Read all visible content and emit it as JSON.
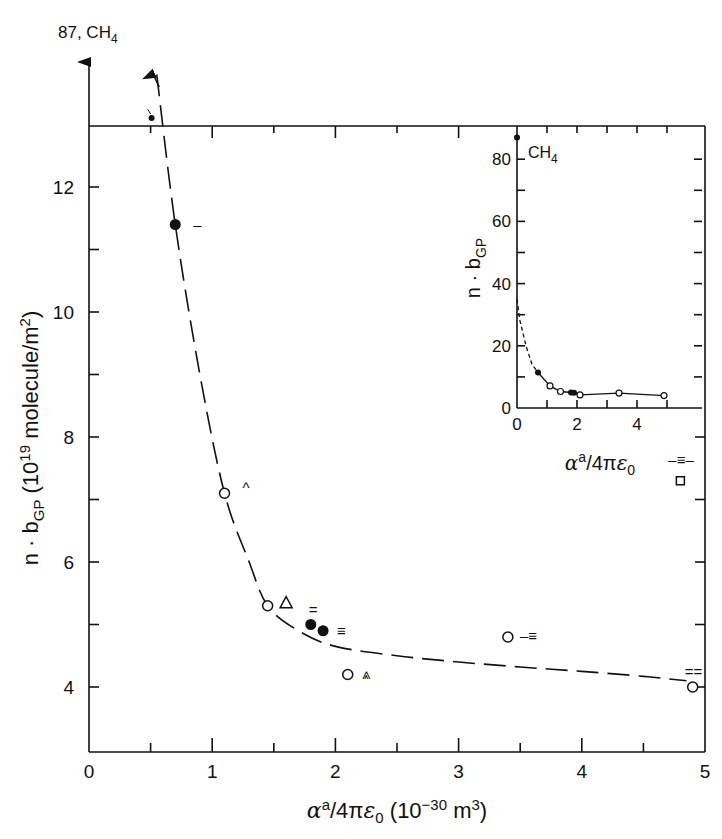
{
  "chart_data": [
    {
      "id": "main",
      "type": "scatter",
      "title": "",
      "xlabel": "α^a/4πε0 (10^-30 m^3)",
      "ylabel": "n·bGP (10^19 molecule/m^2)",
      "xlim": [
        0,
        5
      ],
      "ylim": [
        3,
        13
      ],
      "x_ticks": [
        "0",
        "1",
        "2",
        "3",
        "4",
        "5"
      ],
      "y_ticks": [
        "4",
        "6",
        "8",
        "10",
        "12"
      ],
      "grid": false,
      "off_scale_annotation": "87, CH4",
      "points": [
        {
          "x": 0.5,
          "y": 13.2,
          "marker": "small-filled",
          "label": ""
        },
        {
          "x": 0.7,
          "y": 11.4,
          "marker": "filled-circle",
          "label": "–"
        },
        {
          "x": 1.1,
          "y": 7.1,
          "marker": "open-circle",
          "label": "^"
        },
        {
          "x": 1.45,
          "y": 5.3,
          "marker": "open-circle",
          "label": ""
        },
        {
          "x": 1.6,
          "y": 5.35,
          "marker": "triangle",
          "label": ""
        },
        {
          "x": 1.8,
          "y": 5.0,
          "marker": "filled-circle",
          "label": "="
        },
        {
          "x": 1.9,
          "y": 4.9,
          "marker": "filled-circle",
          "label": "≡"
        },
        {
          "x": 2.1,
          "y": 4.2,
          "marker": "open-circle",
          "label": "⩓"
        },
        {
          "x": 3.4,
          "y": 4.8,
          "marker": "open-circle",
          "label": "–≡"
        },
        {
          "x": 4.9,
          "y": 4.0,
          "marker": "open-circle",
          "label": "=="
        },
        {
          "x": 4.8,
          "y": 7.3,
          "marker": "square",
          "label": "–≡–"
        }
      ],
      "curve": {
        "style": "long-dash",
        "x": [
          0.55,
          0.7,
          0.9,
          1.1,
          1.3,
          1.45,
          1.7,
          2.0,
          2.5,
          3.0,
          3.5,
          4.0,
          4.5,
          4.85
        ],
        "y": [
          13.8,
          11.4,
          9.0,
          7.1,
          6.0,
          5.3,
          4.9,
          4.65,
          4.5,
          4.4,
          4.32,
          4.25,
          4.17,
          4.1
        ]
      }
    },
    {
      "id": "inset",
      "type": "scatter",
      "title": "",
      "xlabel": "α^a/4πε0",
      "ylabel": "n·bGP",
      "xlim": [
        0,
        6
      ],
      "ylim": [
        0,
        90
      ],
      "x_ticks": [
        "0",
        "2",
        "4"
      ],
      "y_ticks": [
        "0",
        "20",
        "40",
        "60",
        "80"
      ],
      "annotation": "CH4",
      "points": [
        {
          "x": 0.0,
          "y": 87,
          "marker": "filled-circle"
        },
        {
          "x": 0.7,
          "y": 11.4,
          "marker": "filled-circle"
        },
        {
          "x": 1.1,
          "y": 7.1,
          "marker": "open-circle"
        },
        {
          "x": 1.45,
          "y": 5.3,
          "marker": "open-circle"
        },
        {
          "x": 1.8,
          "y": 5.0,
          "marker": "filled-circle"
        },
        {
          "x": 1.9,
          "y": 4.9,
          "marker": "filled-circle"
        },
        {
          "x": 2.1,
          "y": 4.2,
          "marker": "open-circle"
        },
        {
          "x": 3.4,
          "y": 4.8,
          "marker": "open-circle"
        },
        {
          "x": 4.9,
          "y": 4.0,
          "marker": "open-circle"
        }
      ],
      "curve_dashed": {
        "x": [
          0.0,
          0.1,
          0.3,
          0.5,
          0.7
        ],
        "y": [
          35,
          28,
          20,
          14,
          11.4
        ]
      },
      "curve_solid": {
        "x": [
          0.7,
          1.1,
          1.45,
          1.9,
          2.1,
          3.4,
          4.9
        ],
        "y": [
          11.4,
          7.1,
          5.3,
          4.9,
          4.2,
          4.8,
          4.0
        ]
      }
    }
  ],
  "labels": {
    "top_annotation": "87, CH4",
    "main_x_ticks": [
      "0",
      "1",
      "2",
      "3",
      "4",
      "5"
    ],
    "main_y_ticks": [
      "4",
      "6",
      "8",
      "10",
      "12"
    ],
    "inset_x_ticks": [
      "0",
      "2",
      "4"
    ],
    "inset_y_ticks": [
      "0",
      "20",
      "40",
      "60",
      "80"
    ],
    "inset_ch4": "CH4"
  }
}
